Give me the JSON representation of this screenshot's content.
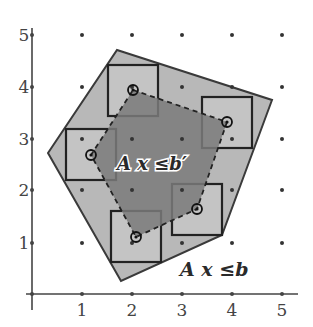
{
  "figure": {
    "type": "integer-hull-diagram",
    "colors": {
      "background": "#ffffff",
      "outer_fill": "#b8b8b8",
      "inner_fill": "#7a7a7a",
      "square_fill": "#c4c4c4",
      "stroke": "#2a2a2a",
      "axis": "#444444",
      "grid_dot": "#333333"
    },
    "axes": {
      "x_ticks": [
        "1",
        "2",
        "3",
        "4",
        "5"
      ],
      "y_ticks": [
        "1",
        "2",
        "3",
        "4",
        "5"
      ],
      "origin_px": [
        32,
        294
      ],
      "unit_px_x": 50,
      "unit_px_y": 51.8
    },
    "labels": {
      "outer_polytope": "A x ≤b",
      "inner_polytope": "A x ≤b′"
    },
    "outer_polygon_px": [
      [
        48,
        153
      ],
      [
        117,
        50
      ],
      [
        272,
        100
      ],
      [
        222,
        235
      ],
      [
        121,
        281
      ]
    ],
    "inner_polygon_px": [
      [
        133,
        90
      ],
      [
        227,
        122
      ],
      [
        197,
        209
      ],
      [
        136,
        237
      ],
      [
        91,
        155
      ]
    ],
    "squares_px": [
      {
        "x": 108,
        "y": 65,
        "size": 50,
        "center": [
          133,
          90
        ]
      },
      {
        "x": 202,
        "y": 97,
        "size": 50,
        "center": [
          227,
          122
        ]
      },
      {
        "x": 66,
        "y": 129,
        "size": 50,
        "center": [
          91,
          155
        ]
      },
      {
        "x": 111,
        "y": 211,
        "size": 50,
        "center": [
          136,
          237
        ]
      },
      {
        "x": 172,
        "y": 184,
        "size": 50,
        "center": [
          197,
          209
        ]
      }
    ]
  }
}
